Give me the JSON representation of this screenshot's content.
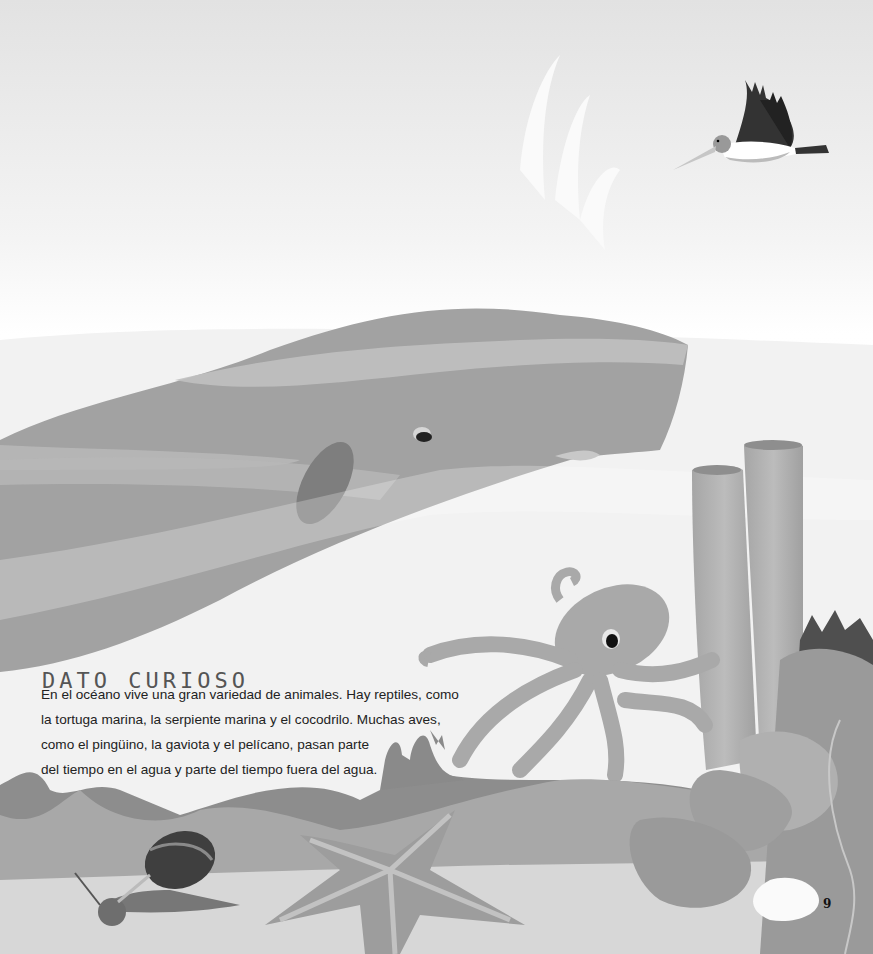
{
  "page": {
    "heading": "DATO CURIOSO",
    "body_lines": [
      "En el océano vive una gran variedad de animales. Hay reptiles, como",
      "la tortuga marina, la serpiente marina y el cocodrilo. Muchas aves,",
      "como el pingüino, la gaviota y el pelícano, pasan parte",
      "del tiempo en el agua y parte del tiempo fuera del agua."
    ],
    "page_number": "9"
  },
  "illustration": {
    "elements": [
      "pelican",
      "whale-spout",
      "sperm-whale",
      "octopus",
      "tube-sponges",
      "coral",
      "snail",
      "starfish",
      "seabed"
    ],
    "colors": {
      "sky_top": "#e4e4e4",
      "water": "#f4f4f4",
      "whale": "#a3a3a3",
      "whale_stripe": "#c2c2c2",
      "fin": "#7d7d7d",
      "octopus": "#a9a9a9",
      "sponge": "#b3b3b3",
      "seabed_dark": "#8a8a8a",
      "seabed_mid": "#a8a8a8",
      "sand": "#d8d8d8",
      "shell_dark": "#4a4a4a"
    }
  }
}
